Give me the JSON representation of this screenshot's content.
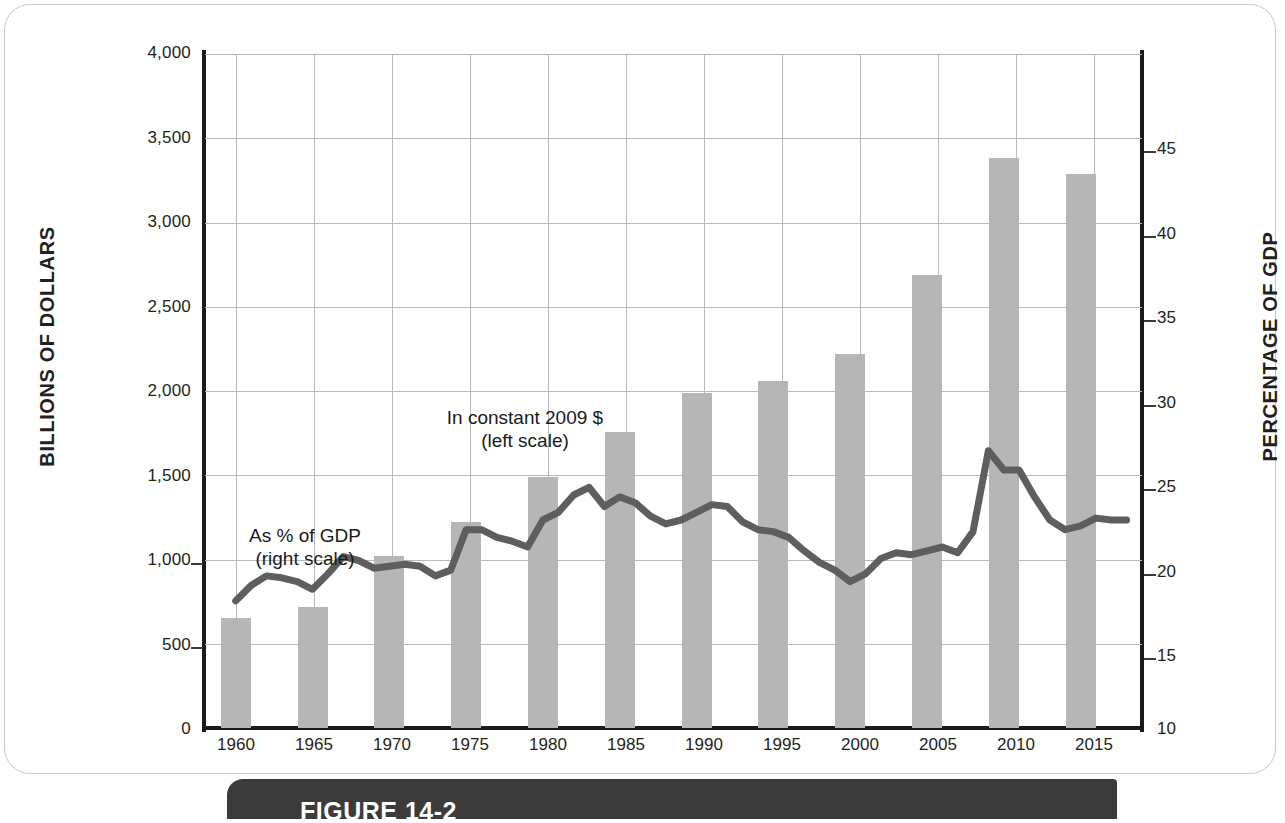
{
  "figure": {
    "caption_label": "FIGURE 14-2"
  },
  "axes": {
    "left_title": "BILLIONS OF DOLLARS",
    "right_title": "PERCENTAGE OF GDP",
    "left_ticks": [
      "4,000",
      "3,500",
      "3,000",
      "2,500",
      "2,000",
      "1,500",
      "1,000",
      "500",
      "0"
    ],
    "right_ticks": [
      "45",
      "40",
      "35",
      "30",
      "25",
      "20",
      "15",
      "10"
    ],
    "x_ticks": [
      "1960",
      "1965",
      "1970",
      "1975",
      "1980",
      "1985",
      "1990",
      "1995",
      "2000",
      "2005",
      "2010",
      "2015"
    ]
  },
  "annotations": {
    "bars_line1": "In constant 2009 $",
    "bars_line2": "(left scale)",
    "line_line1": "As % of GDP",
    "line_line2": "(right scale)"
  },
  "colors": {
    "bar_fill": "#b6b6b6",
    "line_stroke": "#5e5e5e",
    "grid": "#b9b9b9",
    "axis": "#1a1a1a",
    "caption_bg": "#3b3b3b"
  },
  "chart_data": {
    "type": "bar",
    "title": "",
    "xlabel": "",
    "ylabel": "BILLIONS OF DOLLARS",
    "y2label": "PERCENTAGE OF GDP",
    "ylim": [
      0,
      4000
    ],
    "y2lim": [
      10,
      45
    ],
    "xlim": [
      1958,
      2019
    ],
    "grid": true,
    "legend": "annotation-labels",
    "series": [
      {
        "name": "In constant 2009 $ (left scale)",
        "type": "bar",
        "axis": "left",
        "units": "billions of dollars",
        "categories": [
          1960,
          1965,
          1970,
          1975,
          1980,
          1985,
          1990,
          1995,
          2000,
          2005,
          2010,
          2015
        ],
        "values": [
          650,
          720,
          1020,
          1220,
          1490,
          1755,
          1990,
          2060,
          2220,
          2690,
          3380,
          3290
        ]
      },
      {
        "name": "As % of GDP (right scale)",
        "type": "line",
        "axis": "right",
        "units": "percent of GDP",
        "x": [
          1960,
          1961,
          1962,
          1963,
          1964,
          1965,
          1966,
          1967,
          1968,
          1969,
          1970,
          1971,
          1972,
          1973,
          1974,
          1975,
          1976,
          1977,
          1978,
          1979,
          1980,
          1981,
          1982,
          1983,
          1984,
          1985,
          1986,
          1987,
          1988,
          1989,
          1990,
          1991,
          1992,
          1993,
          1994,
          1995,
          1996,
          1997,
          1998,
          1999,
          2000,
          2001,
          2002,
          2003,
          2004,
          2005,
          2006,
          2007,
          2008,
          2009,
          2010,
          2011,
          2012,
          2013,
          2014,
          2015,
          2016,
          2017,
          2018
        ],
        "values": [
          16.6,
          17.4,
          17.9,
          17.8,
          17.6,
          17.2,
          18.0,
          18.9,
          18.7,
          18.3,
          18.4,
          18.5,
          18.4,
          17.9,
          18.2,
          20.3,
          20.3,
          19.9,
          19.7,
          19.4,
          20.8,
          21.2,
          22.1,
          22.5,
          21.5,
          22.0,
          21.7,
          21.0,
          20.6,
          20.8,
          21.2,
          21.6,
          21.5,
          20.7,
          20.3,
          20.2,
          19.9,
          19.2,
          18.6,
          18.2,
          17.6,
          18.0,
          18.8,
          19.1,
          19.0,
          19.2,
          19.4,
          19.1,
          20.2,
          24.4,
          23.4,
          23.4,
          22.0,
          20.8,
          20.3,
          20.5,
          20.9,
          20.8,
          20.8
        ]
      }
    ]
  }
}
